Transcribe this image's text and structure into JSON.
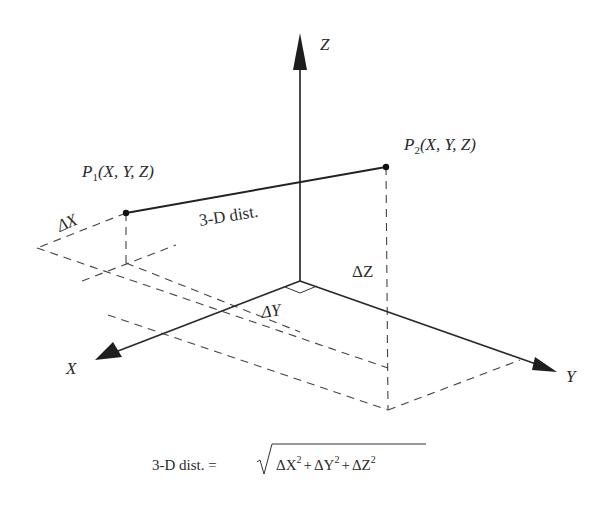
{
  "diagram": {
    "axes": {
      "z_label": "Z",
      "y_label": "Y",
      "x_label": "X"
    },
    "points": {
      "p1": {
        "name": "P",
        "sub": "1",
        "coords": "(X, Y, Z)"
      },
      "p2": {
        "name": "P",
        "sub": "2",
        "coords": "(X, Y, Z)"
      }
    },
    "segment_label": "3-D dist.",
    "deltas": {
      "dx": "ΔX",
      "dy": "ΔY",
      "dz": "ΔZ"
    },
    "formula": {
      "lhs": "3-D dist. =",
      "dx": "ΔX",
      "dy": "ΔY",
      "dz": "ΔZ",
      "exp": "2",
      "plus": "+"
    },
    "colors": {
      "line": "#2a2a2a",
      "background": "#ffffff"
    }
  }
}
